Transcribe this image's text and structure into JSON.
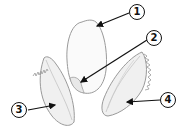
{
  "diagram": {
    "labels": [
      {
        "id": "1",
        "text": "1",
        "target": "brown-rice-kernel"
      },
      {
        "id": "2",
        "text": "2",
        "target": "embryo"
      },
      {
        "id": "3",
        "text": "3",
        "target": "lemma-hull-left"
      },
      {
        "id": "4",
        "text": "4",
        "target": "palea-hull-right"
      }
    ]
  },
  "colors": {
    "outline": "#9a9a9a",
    "fill": "#f4f4f4",
    "arrow": "#111111"
  }
}
